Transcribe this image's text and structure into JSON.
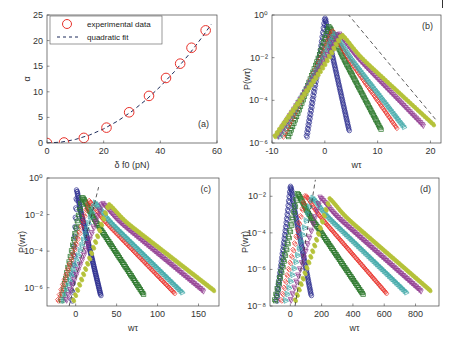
{
  "header": {
    "text": ""
  },
  "chart_data": [
    {
      "panel": "(a)",
      "type": "scatter",
      "title": "",
      "xlabel": "δ f0 (pN)",
      "ylabel": "α",
      "xlim": [
        0,
        60
      ],
      "ylim": [
        0,
        25
      ],
      "xticks": [
        0,
        20,
        40,
        60
      ],
      "yticks": [
        0,
        5,
        10,
        15,
        20,
        25
      ],
      "grid": false,
      "legend": {
        "position": "upper-left",
        "entries": [
          "experimental data",
          "quadratic fit"
        ]
      },
      "series": [
        {
          "name": "experimental data",
          "marker": "circle",
          "color": "#e8312a",
          "x": [
            0,
            6,
            13,
            21,
            29,
            36,
            42,
            47,
            51,
            56
          ],
          "y": [
            0,
            0.1,
            1.0,
            3.0,
            6.0,
            9.2,
            12.7,
            15.5,
            18.6,
            22.0
          ]
        },
        {
          "name": "quadratic fit",
          "style": "dashed",
          "color": "#1c2b5a",
          "x": [
            0,
            5,
            10,
            15,
            20,
            25,
            30,
            35,
            40,
            45,
            50,
            55,
            58
          ],
          "y": [
            0,
            0.17,
            0.69,
            1.55,
            2.76,
            4.31,
            6.2,
            8.44,
            11.03,
            13.96,
            17.23,
            20.85,
            23.2
          ]
        }
      ],
      "annotation": "(a)"
    },
    {
      "panel": "(b)",
      "type": "scatter",
      "xlabel": "wτ",
      "ylabel": "P(wτ)",
      "yscale": "log",
      "xlim": [
        -10,
        22
      ],
      "ylim_exp": [
        -6,
        0
      ],
      "xticks": [
        -10,
        0,
        10,
        20
      ],
      "yticks_exp": [
        -6,
        -4,
        -2,
        0
      ],
      "annotation": "(b)",
      "series": [
        {
          "color": "#2e2f8f",
          "marker": "circle",
          "peak_x": 0,
          "peak_exp": -0.1,
          "left_end": -3.5,
          "right_end": 4.5
        },
        {
          "color": "#2f7a2f",
          "marker": "square",
          "peak_x": 0.8,
          "peak_exp": -0.5,
          "left_end": -7,
          "right_end": 10.5
        },
        {
          "color": "#e8312a",
          "marker": "diamond",
          "peak_x": 1.4,
          "peak_exp": -0.7,
          "left_end": -8,
          "right_end": 13.5
        },
        {
          "color": "#3fa8a8",
          "marker": "triangle-right",
          "peak_x": 2,
          "peak_exp": -0.8,
          "left_end": -8.5,
          "right_end": 15
        },
        {
          "color": "#8f3a8f",
          "marker": "triangle-down",
          "peak_x": 2.6,
          "peak_exp": -0.85,
          "left_end": -9,
          "right_end": 18.5
        },
        {
          "color": "#b5c23a",
          "marker": "star",
          "peak_x": 3.2,
          "peak_exp": -0.9,
          "left_end": -9.5,
          "right_end": 20.5
        }
      ],
      "dashed_line": {
        "x": [
          3.5,
          21
        ],
        "exp": [
          0.3,
          -4.9
        ]
      }
    },
    {
      "panel": "(c)",
      "type": "scatter",
      "xlabel": "wτ",
      "ylabel": "P(wτ)",
      "yscale": "log",
      "xlim": [
        -35,
        175
      ],
      "ylim_exp": [
        -7,
        0
      ],
      "xticks": [
        0,
        50,
        100,
        150
      ],
      "yticks_exp": [
        -6,
        -4,
        -2,
        0
      ],
      "annotation": "(c)",
      "series": [
        {
          "color": "#2e2f8f",
          "marker": "circle",
          "peak_x": 1,
          "peak_exp": -0.65,
          "left_end": -5,
          "right_end": 30
        },
        {
          "color": "#2f7a2f",
          "marker": "square",
          "peak_x": 8,
          "peak_exp": -1.0,
          "left_end": -18,
          "right_end": 82
        },
        {
          "color": "#e8312a",
          "marker": "diamond",
          "peak_x": 16,
          "peak_exp": -1.2,
          "left_end": -22,
          "right_end": 120
        },
        {
          "color": "#3fa8a8",
          "marker": "triangle-right",
          "peak_x": 24,
          "peak_exp": -1.3,
          "left_end": -15,
          "right_end": 130
        },
        {
          "color": "#8f3a8f",
          "marker": "triangle-down",
          "peak_x": 32,
          "peak_exp": -1.35,
          "left_end": -12,
          "right_end": 155
        },
        {
          "color": "#b5c23a",
          "marker": "star",
          "peak_x": 40,
          "peak_exp": -1.4,
          "left_end": -3,
          "right_end": 168
        }
      ],
      "dashed_line": {
        "x": [
          -8,
          28
        ],
        "exp": [
          -7,
          -0.5
        ]
      }
    },
    {
      "panel": "(d)",
      "type": "scatter",
      "xlabel": "wτ",
      "ylabel": "P(wτ)",
      "yscale": "log",
      "xlim": [
        -130,
        950
      ],
      "ylim_exp": [
        -8,
        -1
      ],
      "xticks": [
        0,
        200,
        400,
        600,
        800
      ],
      "yticks_exp": [
        -8,
        -6,
        -4,
        -2
      ],
      "annotation": "(d)",
      "series": [
        {
          "color": "#2e2f8f",
          "marker": "circle",
          "peak_x": 0,
          "peak_exp": -1.4,
          "left_end": -90,
          "right_end": 130
        },
        {
          "color": "#2f7a2f",
          "marker": "square",
          "peak_x": 45,
          "peak_exp": -1.8,
          "left_end": -100,
          "right_end": 460
        },
        {
          "color": "#e8312a",
          "marker": "diamond",
          "peak_x": 95,
          "peak_exp": -1.9,
          "left_end": -60,
          "right_end": 610
        },
        {
          "color": "#3fa8a8",
          "marker": "triangle-right",
          "peak_x": 140,
          "peak_exp": -2.0,
          "left_end": -30,
          "right_end": 740
        },
        {
          "color": "#8f3a8f",
          "marker": "triangle-down",
          "peak_x": 190,
          "peak_exp": -2.05,
          "left_end": 0,
          "right_end": 830
        },
        {
          "color": "#b5c23a",
          "marker": "star",
          "peak_x": 250,
          "peak_exp": -2.1,
          "left_end": 30,
          "right_end": 890
        }
      ],
      "dashed_line": {
        "x": [
          30,
          160
        ],
        "exp": [
          -8,
          -1.1
        ]
      }
    }
  ],
  "panels_layout": [
    {
      "box": [
        47,
        15,
        217,
        143
      ]
    },
    {
      "box": [
        272,
        15,
        441,
        143
      ]
    },
    {
      "box": [
        47,
        178,
        219,
        306
      ]
    },
    {
      "box": [
        270,
        178,
        439,
        306
      ]
    }
  ]
}
